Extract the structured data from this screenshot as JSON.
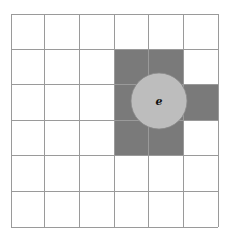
{
  "diagram": {
    "grid": {
      "cols": 6,
      "rows": 6,
      "x_lines": [
        11,
        44,
        79,
        114,
        148,
        183,
        218
      ],
      "y_lines": [
        14,
        49,
        84,
        120,
        155,
        191,
        227
      ],
      "line_color": "#9a9a9a",
      "background": "#ffffff"
    },
    "shaded_cells": [
      {
        "row": 1,
        "col": 3
      },
      {
        "row": 1,
        "col": 4
      },
      {
        "row": 2,
        "col": 3
      },
      {
        "row": 2,
        "col": 4
      },
      {
        "row": 2,
        "col": 5
      },
      {
        "row": 3,
        "col": 3
      },
      {
        "row": 3,
        "col": 4
      }
    ],
    "shade_color": "#7a7a7a",
    "circle": {
      "cx": 159,
      "cy": 101,
      "r": 28,
      "fill": "#bdbdbd",
      "stroke": "#8a8a8a",
      "label": "e"
    }
  }
}
